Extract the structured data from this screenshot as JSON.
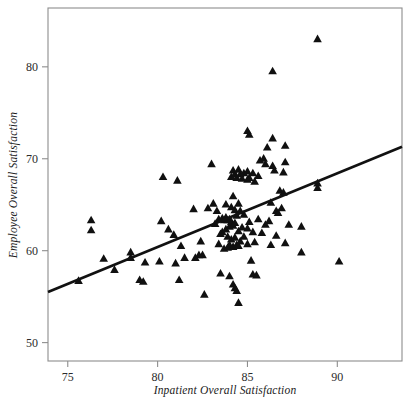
{
  "chart_data": {
    "type": "scatter",
    "title": "",
    "subtitle": "",
    "xlabel": "Inpatient Overall Satisfaction",
    "ylabel": "Employee Overall Satisfaction",
    "xlim": [
      73.9,
      93.6
    ],
    "ylim": [
      48.0,
      86.4
    ],
    "xticks": [
      75,
      80,
      85,
      90
    ],
    "xtick_labels": [
      "75",
      "80",
      "85",
      "90"
    ],
    "yticks": [
      50,
      60,
      70,
      80
    ],
    "ytick_labels": [
      "50",
      "60",
      "70",
      "80"
    ],
    "grid": false,
    "legend": null,
    "marker": "triangle-up",
    "marker_color": "#101010",
    "frame_color": "#8d8d8d",
    "trend_line": {
      "type": "linear-fit",
      "color": "#111111",
      "x_start": 73.9,
      "y_start": 55.5,
      "x_end": 93.6,
      "y_end": 71.3,
      "slope": 0.802,
      "intercept": -3.78
    },
    "points": [
      [
        76.3,
        63.3
      ],
      [
        76.3,
        62.2
      ],
      [
        75.6,
        56.7
      ],
      [
        77.0,
        59.1
      ],
      [
        77.6,
        57.9
      ],
      [
        78.5,
        59.8
      ],
      [
        78.5,
        59.2
      ],
      [
        79.0,
        56.8
      ],
      [
        79.2,
        56.6
      ],
      [
        79.3,
        58.7
      ],
      [
        80.1,
        58.8
      ],
      [
        80.2,
        63.2
      ],
      [
        80.3,
        68.0
      ],
      [
        80.6,
        62.3
      ],
      [
        80.9,
        61.7
      ],
      [
        81.0,
        58.6
      ],
      [
        81.1,
        67.6
      ],
      [
        81.2,
        56.8
      ],
      [
        81.3,
        60.5
      ],
      [
        81.5,
        59.2
      ],
      [
        82.0,
        64.5
      ],
      [
        82.1,
        59.2
      ],
      [
        82.3,
        59.5
      ],
      [
        82.4,
        61.0
      ],
      [
        82.5,
        59.5
      ],
      [
        82.6,
        55.2
      ],
      [
        82.8,
        64.6
      ],
      [
        83.0,
        69.4
      ],
      [
        83.1,
        65.1
      ],
      [
        83.2,
        62.9
      ],
      [
        83.3,
        64.3
      ],
      [
        83.4,
        63.4
      ],
      [
        83.4,
        60.7
      ],
      [
        83.5,
        61.8
      ],
      [
        83.5,
        57.5
      ],
      [
        83.6,
        63.5
      ],
      [
        83.6,
        62.0
      ],
      [
        83.7,
        63.3
      ],
      [
        83.7,
        60.2
      ],
      [
        83.8,
        65.0
      ],
      [
        83.8,
        63.6
      ],
      [
        83.8,
        62.3
      ],
      [
        83.9,
        63.3
      ],
      [
        83.9,
        61.5
      ],
      [
        83.9,
        60.3
      ],
      [
        84.0,
        63.4
      ],
      [
        84.0,
        62.6
      ],
      [
        84.0,
        60.6
      ],
      [
        84.0,
        57.2
      ],
      [
        84.1,
        68.0
      ],
      [
        84.1,
        64.7
      ],
      [
        84.1,
        63.1
      ],
      [
        84.1,
        61.2
      ],
      [
        84.2,
        68.7
      ],
      [
        84.2,
        65.9
      ],
      [
        84.2,
        62.7
      ],
      [
        84.2,
        60.4
      ],
      [
        84.2,
        56.3
      ],
      [
        84.3,
        68.3
      ],
      [
        84.3,
        64.4
      ],
      [
        84.3,
        63.0
      ],
      [
        84.3,
        61.4
      ],
      [
        84.3,
        55.9
      ],
      [
        84.4,
        67.9
      ],
      [
        84.4,
        63.8
      ],
      [
        84.4,
        60.6
      ],
      [
        84.4,
        55.6
      ],
      [
        84.5,
        68.8
      ],
      [
        84.5,
        65.1
      ],
      [
        84.5,
        62.1
      ],
      [
        84.5,
        60.5
      ],
      [
        84.5,
        54.3
      ],
      [
        84.6,
        68.3
      ],
      [
        84.6,
        64.3
      ],
      [
        84.6,
        61.0
      ],
      [
        84.7,
        67.8
      ],
      [
        84.7,
        62.5
      ],
      [
        84.8,
        68.4
      ],
      [
        84.8,
        63.9
      ],
      [
        84.8,
        61.5
      ],
      [
        85.0,
        73.0
      ],
      [
        85.0,
        68.6
      ],
      [
        85.0,
        67.7
      ],
      [
        85.0,
        62.4
      ],
      [
        85.0,
        60.7
      ],
      [
        85.1,
        72.6
      ],
      [
        85.1,
        67.9
      ],
      [
        85.1,
        63.1
      ],
      [
        85.2,
        58.9
      ],
      [
        85.3,
        68.4
      ],
      [
        85.3,
        62.0
      ],
      [
        85.3,
        57.4
      ],
      [
        85.4,
        67.5
      ],
      [
        85.4,
        60.9
      ],
      [
        85.5,
        57.3
      ],
      [
        85.6,
        68.1
      ],
      [
        85.6,
        63.4
      ],
      [
        85.7,
        69.8
      ],
      [
        85.8,
        61.9
      ],
      [
        85.9,
        70.0
      ],
      [
        86.0,
        69.4
      ],
      [
        86.0,
        62.8
      ],
      [
        86.1,
        71.2
      ],
      [
        86.2,
        63.2
      ],
      [
        86.3,
        65.2
      ],
      [
        86.3,
        60.6
      ],
      [
        86.4,
        79.5
      ],
      [
        86.4,
        72.2
      ],
      [
        86.4,
        69.2
      ],
      [
        86.5,
        68.7
      ],
      [
        86.6,
        64.3
      ],
      [
        86.6,
        61.6
      ],
      [
        86.7,
        64.1
      ],
      [
        86.8,
        66.5
      ],
      [
        86.9,
        64.6
      ],
      [
        87.0,
        66.3
      ],
      [
        87.0,
        68.5
      ],
      [
        87.1,
        71.4
      ],
      [
        87.1,
        69.6
      ],
      [
        87.1,
        60.8
      ],
      [
        87.3,
        62.8
      ],
      [
        88.0,
        62.6
      ],
      [
        88.0,
        59.8
      ],
      [
        88.9,
        83.0
      ],
      [
        88.9,
        67.3
      ],
      [
        88.9,
        66.8
      ],
      [
        90.1,
        58.8
      ]
    ]
  }
}
